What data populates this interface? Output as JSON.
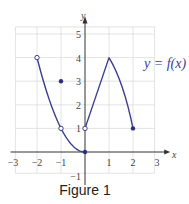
{
  "chart_data": {
    "type": "line",
    "title": "",
    "caption": "Figure 1",
    "xlabel": "x",
    "ylabel": "y",
    "xlim": [
      -3,
      3
    ],
    "ylim": [
      -1,
      5
    ],
    "grid": true,
    "x_ticks": [
      "−3",
      "−2",
      "−1",
      "1",
      "2",
      "3"
    ],
    "y_ticks": [
      "−1",
      "1",
      "2",
      "3",
      "4",
      "5"
    ],
    "annotation": "y = f(x)",
    "series": [
      {
        "name": "parabola piece",
        "points": [
          [
            -2,
            4
          ],
          [
            -1,
            1
          ],
          [
            0,
            0
          ]
        ],
        "shape": "curve",
        "note": "y = x^2 on (-2, 0]"
      },
      {
        "name": "linear rise",
        "points": [
          [
            0,
            1
          ],
          [
            1,
            4
          ]
        ],
        "shape": "line"
      },
      {
        "name": "curved descent",
        "points": [
          [
            1,
            4
          ],
          [
            2,
            1
          ]
        ],
        "shape": "curve"
      }
    ],
    "open_points": [
      [
        -2,
        4
      ],
      [
        -1,
        1
      ],
      [
        0,
        1
      ]
    ],
    "closed_points": [
      [
        -1,
        3
      ],
      [
        0,
        0
      ],
      [
        2,
        1
      ]
    ],
    "colors": {
      "curve": "#3a3f8f",
      "grid": "#d9d9d9",
      "axis": "#333333"
    }
  }
}
